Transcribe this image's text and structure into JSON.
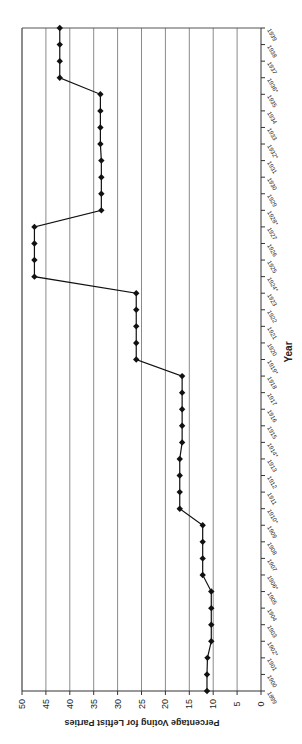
{
  "chart_data": {
    "type": "line",
    "title": "",
    "xlabel": "Year",
    "ylabel": "Percentage Voting for Leftist Parties",
    "ylim": [
      0,
      50
    ],
    "yticks": [
      0,
      5,
      10,
      15,
      20,
      25,
      30,
      35,
      40,
      45,
      50
    ],
    "grid": true,
    "legend": null,
    "orientation_note": "figure rendered rotated 90 degrees",
    "categories": [
      "1899",
      "1900",
      "1901",
      "1902*",
      "1903",
      "1904",
      "1905",
      "1906*",
      "1907",
      "1908",
      "1909",
      "1910*",
      "1911",
      "1912",
      "1913",
      "1914*",
      "1915",
      "1916",
      "1917",
      "1918",
      "1919*",
      "1920",
      "1921",
      "1922",
      "1923",
      "1924*",
      "1925",
      "1926",
      "1927",
      "1928*",
      "1929",
      "1930",
      "1931",
      "1932*",
      "1933",
      "1934",
      "1935",
      "1936*",
      "1937",
      "1938",
      "1939"
    ],
    "series": [
      {
        "name": "Percentage Voting for Leftist Parties",
        "marker": "diamond",
        "color": "#111111",
        "values": [
          11.3,
          11.3,
          11.2,
          10.4,
          10.4,
          10.4,
          10.4,
          12.2,
          12.2,
          12.2,
          12.2,
          17.0,
          17.0,
          17.0,
          17.0,
          16.5,
          16.5,
          16.5,
          16.5,
          16.5,
          26.1,
          26.1,
          26.1,
          26.1,
          26.1,
          47.4,
          47.4,
          47.4,
          47.4,
          33.4,
          33.4,
          33.4,
          33.4,
          33.6,
          33.6,
          33.6,
          33.6,
          42.1,
          42.1,
          42.1,
          42.1
        ]
      }
    ]
  }
}
